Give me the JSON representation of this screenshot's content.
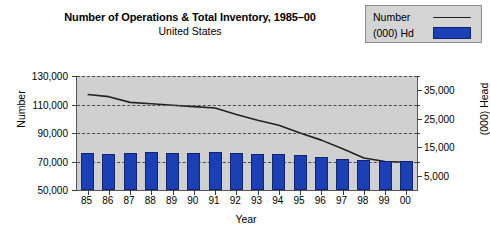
{
  "title": "Number of Operations & Total Inventory, 1985–00",
  "subtitle": "United States",
  "legend": {
    "items": [
      {
        "label": "Number",
        "marker": "line",
        "color": "#222222"
      },
      {
        "label": "(000) Hd",
        "marker": "bar",
        "color": "#1b3fb4"
      }
    ]
  },
  "colors": {
    "plot_background": "#d0d0d0",
    "bar_fill": "#1b3fb4",
    "bar_border": "#11246e",
    "line": "#222222",
    "gridline": "#4a4a4a",
    "legend_background": "#d4d4d4",
    "legend_border": "#8c8c8c"
  },
  "chart_data": {
    "type": "bar",
    "title": "Number of Operations & Total Inventory, 1985–00",
    "subtitle": "United States",
    "xlabel": "Year",
    "ylabel": "Number",
    "y2label": "(000) Head",
    "grid": true,
    "legend_position": "top-right",
    "categories": [
      "85",
      "86",
      "87",
      "88",
      "89",
      "90",
      "91",
      "92",
      "93",
      "94",
      "95",
      "96",
      "97",
      "98",
      "99",
      "00"
    ],
    "ylim": [
      50000,
      130000
    ],
    "yticks": [
      "50,000",
      "70,000",
      "90,000",
      "110,000",
      "130,000"
    ],
    "ytick_values": [
      50000,
      70000,
      90000,
      110000,
      130000
    ],
    "y2lim": [
      0,
      40000
    ],
    "y2ticks": [
      "5,000",
      "15,000",
      "25,000",
      "35,000"
    ],
    "y2tick_values": [
      5000,
      15000,
      25000,
      35000
    ],
    "y2minor_values": [
      10000,
      20000,
      30000,
      40000
    ],
    "series": [
      {
        "name": "Number",
        "type": "line",
        "axis": "left",
        "color": "#222222",
        "values": [
          117000,
          115500,
          111500,
          110500,
          109500,
          108500,
          107500,
          103000,
          99000,
          95500,
          90000,
          85000,
          79000,
          72500,
          70000,
          69500
        ]
      },
      {
        "name": "(000) Hd",
        "type": "bar",
        "axis": "right",
        "color": "#1b3fb4",
        "values": [
          13000,
          12600,
          13100,
          13300,
          13000,
          13100,
          13500,
          13100,
          12600,
          12500,
          12200,
          11500,
          10900,
          10500,
          10200,
          10100
        ]
      }
    ]
  }
}
